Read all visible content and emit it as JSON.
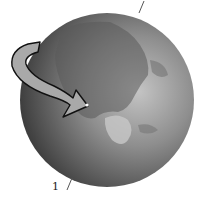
{
  "diagram": {
    "labels": [
      {
        "id": "axis-label",
        "text": "1"
      }
    ],
    "elements": {
      "globe": {
        "fill_dark": "#3c3c3c",
        "fill_light": "#b8b8b8",
        "land_color": "#8a8a8a"
      },
      "rotation_arrow": {
        "direction": "counterclockwise-front-to-right",
        "fill": "#a8a8a8",
        "stroke": "#111111"
      },
      "axis_line": {
        "color": "#444444"
      },
      "location_marker": {
        "color": "#ffffff"
      }
    }
  }
}
